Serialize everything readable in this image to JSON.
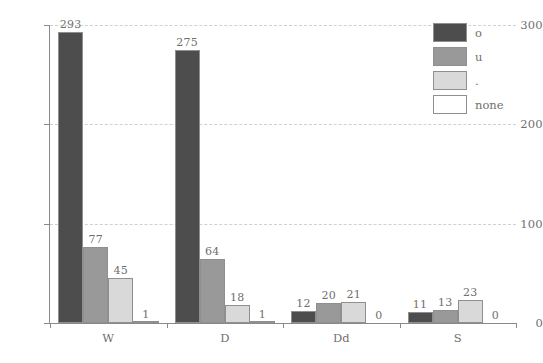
{
  "chart_data": {
    "type": "bar",
    "title": "",
    "subtitle": "",
    "xlabel": "",
    "ylabel": "",
    "categories": [
      "W",
      "D",
      "Dd",
      "S"
    ],
    "series": [
      {
        "name": "o",
        "color": "#4d4d4d",
        "values": [
          293,
          275,
          12,
          11
        ]
      },
      {
        "name": "u",
        "color": "#999999",
        "values": [
          77,
          64,
          20,
          13
        ]
      },
      {
        "name": ".",
        "color": "#d9d9d9",
        "values": [
          45,
          18,
          21,
          23
        ]
      },
      {
        "name": "none",
        "color": "#ffffff",
        "values": [
          1,
          1,
          0,
          0
        ]
      }
    ],
    "ylim": [
      0,
      300
    ],
    "yticks": [
      0,
      100,
      200,
      300
    ],
    "ytick_labels": [
      "0",
      "100",
      "200",
      "300"
    ],
    "grid": true,
    "grid_axis": "y",
    "grid_style": "dashed",
    "grid_color": "#d0d0d0",
    "legend_position": "top-right",
    "bar_labels_shown": true,
    "bar_border_color": "#8f8f8f",
    "axis_color": "#8a8a8a",
    "text_color": "#6f6f6f",
    "background": "#ffffff"
  },
  "legend": {
    "entries": [
      {
        "label": "o"
      },
      {
        "label": "u"
      },
      {
        "label": "."
      },
      {
        "label": "none"
      }
    ]
  },
  "axes": {
    "y_ticks": [
      {
        "label": "300",
        "value": 300
      },
      {
        "label": "200",
        "value": 200
      },
      {
        "label": "100",
        "value": 100
      },
      {
        "label": "0",
        "value": 0
      }
    ],
    "x_groups": [
      {
        "label": "W"
      },
      {
        "label": "D"
      },
      {
        "label": "Dd"
      },
      {
        "label": "S"
      }
    ]
  },
  "bar_value_labels": {
    "W": [
      "293",
      "77",
      "45",
      "1"
    ],
    "D": [
      "275",
      "64",
      "18",
      "1"
    ],
    "Dd": [
      "12",
      "20",
      "21",
      "0"
    ],
    "S": [
      "11",
      "13",
      "23",
      "0"
    ]
  }
}
